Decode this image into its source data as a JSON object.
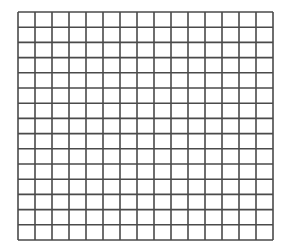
{
  "grid": {
    "rows": 15,
    "columns": 15,
    "line_color": "#4a4a4a",
    "background_color": "#ffffff",
    "line_width": 1.6
  }
}
